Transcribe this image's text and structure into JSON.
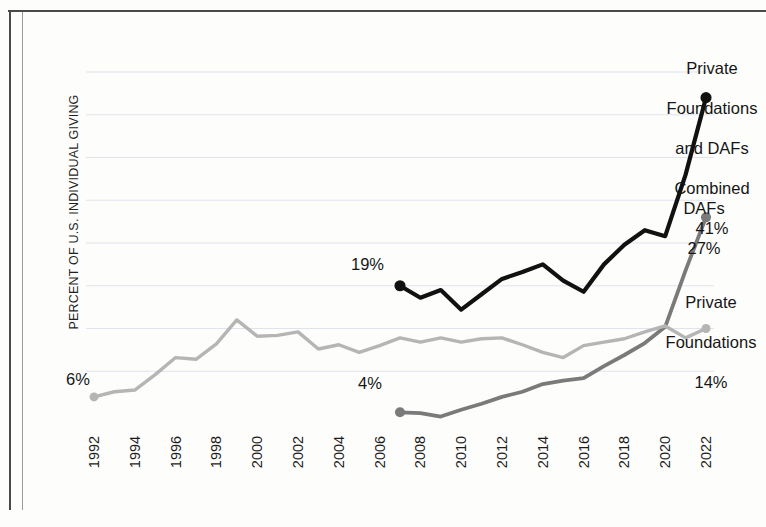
{
  "figure": {
    "y_axis_title": "PERCENT OF U.S. INDIVIDUAL GIVING"
  },
  "annotations": {
    "combined": {
      "line1": "Private",
      "line2": "Foundations",
      "line3": "and DAFs",
      "line4": "Combined",
      "value": "41%"
    },
    "dafs": {
      "line1": "DAFs",
      "value": "27%"
    },
    "private_foundations": {
      "line1": "Private",
      "line2": "Foundations",
      "value": "14%"
    },
    "start_pf": "6%",
    "start_combined": "19%",
    "start_dafs": "4%"
  },
  "colors": {
    "combined": "#111111",
    "dafs": "#7a7a7a",
    "private_foundations": "#b5b5b5",
    "gridline": "#dfe3ea",
    "frame": "#4a4a4a",
    "text": "#161616"
  },
  "chart_data": {
    "type": "line",
    "title": "",
    "subtitle": "",
    "xlabel": "",
    "ylabel": "PERCENT OF U.S. INDIVIDUAL GIVING",
    "grid": true,
    "legend_position": "right-inline-labels",
    "xlim": [
      1992,
      2022
    ],
    "ylim": [
      4,
      44
    ],
    "x": [
      1992,
      1993,
      1994,
      1995,
      1996,
      1997,
      1998,
      1999,
      2000,
      2001,
      2002,
      2003,
      2004,
      2005,
      2006,
      2007,
      2008,
      2009,
      2010,
      2011,
      2012,
      2013,
      2014,
      2015,
      2016,
      2017,
      2018,
      2019,
      2020,
      2021,
      2022
    ],
    "tick_labels": [
      "1992",
      "1994",
      "1996",
      "1998",
      "2000",
      "2002",
      "2004",
      "2006",
      "2008",
      "2010",
      "2012",
      "2014",
      "2016",
      "2018",
      "2020",
      "2022"
    ],
    "tick_values": [
      1992,
      1994,
      1996,
      1998,
      2000,
      2002,
      2004,
      2006,
      2008,
      2010,
      2012,
      2014,
      2016,
      2018,
      2020,
      2022
    ],
    "gridline_values": [
      9,
      14,
      19,
      24,
      29,
      34,
      39,
      44
    ],
    "series": [
      {
        "name": "Private Foundations and DAFs Combined",
        "color": "#111111",
        "width": 4.2,
        "start_label": "19%",
        "end_label": "41%",
        "x": [
          2007,
          2008,
          2009,
          2010,
          2011,
          2012,
          2013,
          2014,
          2015,
          2016,
          2017,
          2018,
          2019,
          2020,
          2021,
          2022
        ],
        "values": [
          19.0,
          17.6,
          18.5,
          16.2,
          18.0,
          19.8,
          20.6,
          21.5,
          19.6,
          18.3,
          21.5,
          23.8,
          25.5,
          24.8,
          32.0,
          41.0
        ]
      },
      {
        "name": "DAFs",
        "color": "#7a7a7a",
        "width": 3.8,
        "start_label": "4%",
        "end_label": "27%",
        "x": [
          2007,
          2008,
          2009,
          2010,
          2011,
          2012,
          2013,
          2014,
          2015,
          2016,
          2017,
          2018,
          2019,
          2020,
          2021,
          2022
        ],
        "values": [
          4.2,
          4.1,
          3.7,
          4.5,
          5.2,
          6.0,
          6.6,
          7.5,
          7.9,
          8.2,
          9.6,
          10.9,
          12.3,
          14.2,
          20.8,
          27.0
        ]
      },
      {
        "name": "Private Foundations",
        "color": "#b5b5b5",
        "width": 3.4,
        "start_label": "6%",
        "end_label": "14%",
        "x": [
          1992,
          1993,
          1994,
          1995,
          1996,
          1997,
          1998,
          1999,
          2000,
          2001,
          2002,
          2003,
          2004,
          2005,
          2006,
          2007,
          2008,
          2009,
          2010,
          2011,
          2012,
          2013,
          2014,
          2015,
          2016,
          2017,
          2018,
          2019,
          2020,
          2021,
          2022
        ],
        "values": [
          6.0,
          6.6,
          6.8,
          8.6,
          10.6,
          10.4,
          12.2,
          15.0,
          13.1,
          13.2,
          13.6,
          11.6,
          12.1,
          11.2,
          12.0,
          12.9,
          12.4,
          12.9,
          12.4,
          12.8,
          12.9,
          12.1,
          11.2,
          10.6,
          12.0,
          12.4,
          12.8,
          13.6,
          14.3,
          12.9,
          14.0
        ]
      }
    ]
  }
}
